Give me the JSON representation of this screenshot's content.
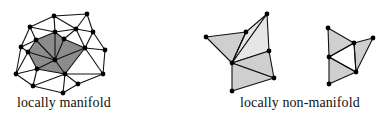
{
  "figures": [
    {
      "id": "manifold",
      "label": "locally manifold",
      "fill_color": "#8c8c8c",
      "edge_color": "#111111",
      "vertex_color": "#000000",
      "vertices": {
        "a": [
          54,
          16
        ],
        "b": [
          87,
          14
        ],
        "c": [
          30,
          27
        ],
        "d": [
          55,
          32
        ],
        "e": [
          64,
          39
        ],
        "f": [
          76,
          29
        ],
        "g": [
          93,
          32
        ],
        "h": [
          36,
          40
        ],
        "i": [
          21,
          47
        ],
        "j": [
          28,
          52
        ],
        "k": [
          85,
          48
        ],
        "l": [
          105,
          50
        ],
        "m": [
          55,
          60
        ],
        "n": [
          37,
          69
        ],
        "o": [
          16,
          74
        ],
        "p": [
          65,
          74
        ],
        "q": [
          103,
          74
        ],
        "r": [
          33,
          86
        ],
        "s": [
          78,
          84
        ],
        "t": [
          63,
          93
        ]
      },
      "filled_polygon": [
        "h",
        "d",
        "e",
        "k",
        "p",
        "n",
        "j"
      ],
      "edges": [
        [
          "a",
          "c"
        ],
        [
          "a",
          "b"
        ],
        [
          "a",
          "d"
        ],
        [
          "a",
          "f"
        ],
        [
          "b",
          "f"
        ],
        [
          "b",
          "g"
        ],
        [
          "c",
          "h"
        ],
        [
          "c",
          "d"
        ],
        [
          "c",
          "i"
        ],
        [
          "f",
          "e"
        ],
        [
          "f",
          "g"
        ],
        [
          "f",
          "k"
        ],
        [
          "f",
          "d"
        ],
        [
          "g",
          "k"
        ],
        [
          "g",
          "l"
        ],
        [
          "l",
          "k"
        ],
        [
          "l",
          "q"
        ],
        [
          "q",
          "k"
        ],
        [
          "q",
          "p"
        ],
        [
          "q",
          "s"
        ],
        [
          "s",
          "p"
        ],
        [
          "s",
          "t"
        ],
        [
          "t",
          "p"
        ],
        [
          "t",
          "r"
        ],
        [
          "r",
          "n"
        ],
        [
          "r",
          "o"
        ],
        [
          "r",
          "p"
        ],
        [
          "o",
          "i"
        ],
        [
          "o",
          "j"
        ],
        [
          "o",
          "n"
        ],
        [
          "i",
          "h"
        ],
        [
          "i",
          "j"
        ],
        [
          "h",
          "d"
        ],
        [
          "d",
          "e"
        ],
        [
          "e",
          "k"
        ],
        [
          "k",
          "p"
        ],
        [
          "p",
          "n"
        ],
        [
          "n",
          "j"
        ],
        [
          "j",
          "h"
        ],
        [
          "m",
          "h"
        ],
        [
          "m",
          "d"
        ],
        [
          "m",
          "e"
        ],
        [
          "m",
          "k"
        ],
        [
          "m",
          "p"
        ],
        [
          "m",
          "n"
        ],
        [
          "m",
          "j"
        ]
      ]
    },
    {
      "id": "non-manifold",
      "label": "locally non-manifold",
      "fill_color": "#cfcfcf",
      "fill_light": "#e6e6e6",
      "edge_color": "#111111",
      "vertex_color": "#000000",
      "vertices": {
        "A": [
          206,
          37
        ],
        "B": [
          246,
          32
        ],
        "C": [
          267,
          14
        ],
        "D": [
          269,
          51
        ],
        "E": [
          232,
          63
        ],
        "F": [
          274,
          78
        ],
        "G": [
          232,
          91
        ],
        "P": [
          328,
          28
        ],
        "Q": [
          354,
          43
        ],
        "R": [
          373,
          38
        ],
        "S": [
          329,
          57
        ],
        "T": [
          356,
          72
        ],
        "U": [
          329,
          84
        ]
      },
      "triangles": [
        {
          "v": [
            "A",
            "B",
            "E"
          ],
          "shade": "fill_color"
        },
        {
          "v": [
            "B",
            "C",
            "E"
          ],
          "shade": "fill_light"
        },
        {
          "v": [
            "C",
            "D",
            "E"
          ],
          "shade": "fill_light"
        },
        {
          "v": [
            "D",
            "F",
            "E"
          ],
          "shade": "fill_color"
        },
        {
          "v": [
            "E",
            "F",
            "G"
          ],
          "shade": "fill_color"
        },
        {
          "v": [
            "P",
            "Q",
            "S"
          ],
          "shade": "fill_color"
        },
        {
          "v": [
            "Q",
            "R",
            "T"
          ],
          "shade": "fill_color"
        },
        {
          "v": [
            "S",
            "T",
            "U"
          ],
          "shade": "fill_color"
        }
      ],
      "extra_edges": [
        [
          "Q",
          "S"
        ],
        [
          "Q",
          "T"
        ],
        [
          "S",
          "T"
        ],
        [
          "B",
          "E"
        ]
      ]
    }
  ],
  "labels": {
    "left": "locally manifold",
    "right": "locally non-manifold"
  }
}
